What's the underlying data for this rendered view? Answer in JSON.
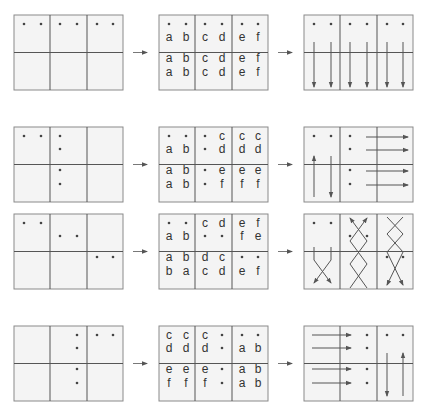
{
  "figure": {
    "flow_arrow_glyph": "→",
    "rows": [
      {
        "id": "row-1",
        "initial_dots": [
          [
            0,
            0
          ],
          [
            0,
            1
          ],
          [
            0,
            2
          ],
          [
            0,
            3
          ],
          [
            0,
            4
          ],
          [
            0,
            5
          ]
        ],
        "labels": [
          [
            "·",
            "·",
            "·",
            "·",
            "·",
            "·"
          ],
          [
            "a",
            "b",
            "c",
            "d",
            "e",
            "f"
          ],
          [
            "a",
            "b",
            "c",
            "d",
            "e",
            "f"
          ],
          [
            "a",
            "b",
            "c",
            "d",
            "e",
            "f"
          ]
        ],
        "motion": "all six particles move vertically downward"
      },
      {
        "id": "row-2",
        "initial_dots": [
          [
            0,
            0
          ],
          [
            0,
            1
          ],
          [
            0,
            2
          ],
          [
            1,
            2
          ],
          [
            2,
            2
          ],
          [
            3,
            2
          ]
        ],
        "labels": [
          [
            "·",
            "·",
            "·",
            "c",
            "c",
            "c"
          ],
          [
            "a",
            "b",
            "·",
            "d",
            "d",
            "d"
          ],
          [
            "a",
            "b",
            "·",
            "e",
            "e",
            "e"
          ],
          [
            "a",
            "b",
            "·",
            "f",
            "f",
            "f"
          ]
        ],
        "motion": "two vertical particles (one up, one down) and four horizontal particles moving right"
      },
      {
        "id": "row-3",
        "initial_dots": [
          [
            0,
            0
          ],
          [
            0,
            1
          ],
          [
            1,
            2
          ],
          [
            1,
            3
          ],
          [
            2,
            4
          ],
          [
            2,
            5
          ]
        ],
        "labels": [
          [
            "·",
            "·",
            "c",
            "d",
            "e",
            "f"
          ],
          [
            "a",
            "b",
            "·",
            "·",
            "f",
            "e"
          ],
          [
            "a",
            "b",
            "d",
            "c",
            "·",
            "·"
          ],
          [
            "b",
            "a",
            "c",
            "d",
            "e",
            "f"
          ]
        ],
        "motion": "crossing (braided) trajectories in each column pair"
      },
      {
        "id": "row-4",
        "initial_dots": [
          [
            0,
            3
          ],
          [
            1,
            3
          ],
          [
            2,
            3
          ],
          [
            3,
            3
          ],
          [
            0,
            4
          ],
          [
            0,
            5
          ]
        ],
        "labels": [
          [
            "c",
            "c",
            "c",
            "·",
            "·",
            "·"
          ],
          [
            "d",
            "d",
            "d",
            "·",
            "a",
            "b"
          ],
          [
            "e",
            "e",
            "e",
            "·",
            "a",
            "b"
          ],
          [
            "f",
            "f",
            "f",
            "·",
            "a",
            "b"
          ]
        ],
        "motion": "four horizontal particles moving right and two vertical particles (one down, one up)"
      }
    ]
  }
}
